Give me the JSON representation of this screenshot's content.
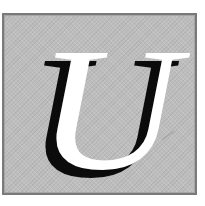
{
  "initial": {
    "letter": "U",
    "style": "italic serif drop cap",
    "letter_color": "#ffffff",
    "shadow_color": "#0b0b0b",
    "background_color": "#bdbdbd",
    "border_color": "#7a7a7a"
  }
}
